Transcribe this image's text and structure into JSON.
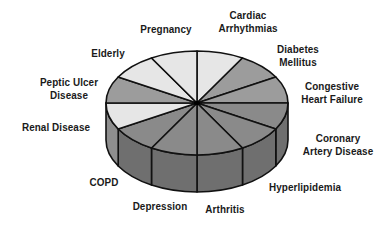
{
  "chart_data": {
    "type": "pie",
    "style": "3d-cylinder",
    "title": "",
    "categories": [
      "Cardiac Arrhythmias",
      "Diabetes Mellitus",
      "Congestive Heart Failure",
      "Coronary Artery Disease",
      "Hyperlipidemia",
      "Arthritis",
      "Depression",
      "COPD",
      "Renal Disease",
      "Peptic Ulcer Disease",
      "Elderly",
      "Pregnancy"
    ],
    "values": [
      1,
      1,
      1,
      1,
      1,
      1,
      1,
      1,
      1,
      1,
      1,
      1
    ],
    "legend": "none (labels placed around pie)",
    "slice_shades": {
      "light": "#e6e6e6",
      "medium": "#9c9c9c",
      "dark": "#8a8a8a",
      "side": "#6f6f6f",
      "outline": "#111111"
    },
    "slice_tone": [
      "light",
      "medium",
      "medium",
      "dark",
      "dark",
      "dark",
      "dark",
      "dark",
      "light",
      "medium",
      "light",
      "light"
    ]
  },
  "labels": [
    {
      "lines": [
        "Cardiac",
        "Arrhythmias"
      ],
      "x": 248,
      "y": 22
    },
    {
      "lines": [
        "Diabetes",
        "Mellitus"
      ],
      "x": 298,
      "y": 56
    },
    {
      "lines": [
        "Congestive",
        "Heart Failure"
      ],
      "x": 332,
      "y": 93
    },
    {
      "lines": [
        "Coronary",
        "Artery Disease"
      ],
      "x": 338,
      "y": 145
    },
    {
      "lines": [
        "Hyperlipidemia"
      ],
      "x": 305,
      "y": 187
    },
    {
      "lines": [
        "Arthritis"
      ],
      "x": 225,
      "y": 209
    },
    {
      "lines": [
        "Depression"
      ],
      "x": 160,
      "y": 206
    },
    {
      "lines": [
        "COPD"
      ],
      "x": 104,
      "y": 182
    },
    {
      "lines": [
        "Renal Disease"
      ],
      "x": 56,
      "y": 127
    },
    {
      "lines": [
        "Peptic Ulcer",
        "Disease"
      ],
      "x": 69,
      "y": 89
    },
    {
      "lines": [
        "Elderly"
      ],
      "x": 108,
      "y": 53
    },
    {
      "lines": [
        "Pregnancy"
      ],
      "x": 166,
      "y": 29
    }
  ]
}
